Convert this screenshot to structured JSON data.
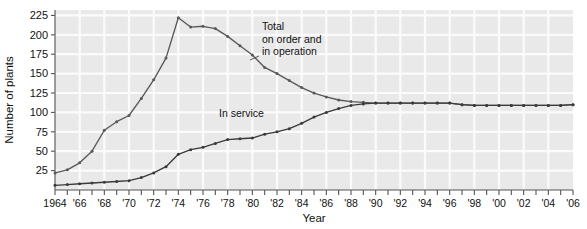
{
  "chart_data": {
    "type": "line",
    "title": "",
    "xlabel": "Year",
    "ylabel": "Number of plants",
    "xlim": [
      1964,
      2006
    ],
    "ylim": [
      0,
      232
    ],
    "yticks": [
      25,
      50,
      75,
      100,
      125,
      150,
      175,
      200,
      225
    ],
    "ytick_labels": [
      "25",
      "50",
      "75",
      "100",
      "125",
      "150",
      "175",
      "200",
      "225"
    ],
    "xticks": [
      1964,
      1965,
      1966,
      1967,
      1968,
      1969,
      1970,
      1971,
      1972,
      1973,
      1974,
      1975,
      1976,
      1977,
      1978,
      1979,
      1980,
      1981,
      1982,
      1983,
      1984,
      1985,
      1986,
      1987,
      1988,
      1989,
      1990,
      1991,
      1992,
      1993,
      1994,
      1995,
      1996,
      1997,
      1998,
      1999,
      2000,
      2001,
      2002,
      2003,
      2004,
      2005,
      2006
    ],
    "xtick_labels": [
      "1964",
      "",
      "'66",
      "",
      "'68",
      "",
      "'70",
      "",
      "'72",
      "",
      "'74",
      "",
      "'76",
      "",
      "'78",
      "",
      "'80",
      "",
      "'82",
      "",
      "'84",
      "",
      "'86",
      "",
      "'88",
      "",
      "'90",
      "",
      "'92",
      "",
      "'94",
      "",
      "'96",
      "",
      "'98",
      "",
      "'00",
      "",
      "'02",
      "",
      "'04",
      "",
      "'06"
    ],
    "grid": true,
    "legend_position": "inline-annotation",
    "x": [
      1964,
      1965,
      1966,
      1967,
      1968,
      1969,
      1970,
      1971,
      1972,
      1973,
      1974,
      1975,
      1976,
      1977,
      1978,
      1979,
      1980,
      1981,
      1982,
      1983,
      1984,
      1985,
      1986,
      1987,
      1988,
      1989,
      1990,
      1991,
      1992,
      1993,
      1994,
      1995,
      1996,
      1997,
      1998,
      1999,
      2000,
      2001,
      2002,
      2003,
      2004,
      2005,
      2006
    ],
    "series": [
      {
        "name": "Total on order and in operation",
        "color": "#595959",
        "values": [
          22,
          26,
          35,
          50,
          77,
          88,
          96,
          118,
          142,
          170,
          222,
          210,
          211,
          208,
          198,
          186,
          174,
          158,
          150,
          141,
          132,
          125,
          120,
          116,
          114,
          113,
          112,
          112,
          112,
          112,
          112,
          112,
          112,
          110,
          109,
          109,
          109,
          109,
          109,
          109,
          109,
          109,
          110
        ]
      },
      {
        "name": "In service",
        "color": "#3a3a3a",
        "values": [
          6,
          7,
          8,
          9,
          10,
          11,
          12,
          16,
          22,
          30,
          46,
          52,
          55,
          60,
          65,
          66,
          67,
          72,
          75,
          79,
          86,
          94,
          100,
          105,
          109,
          111,
          112,
          112,
          112,
          112,
          112,
          112,
          112,
          110,
          109,
          109,
          109,
          109,
          109,
          109,
          109,
          109,
          110
        ]
      }
    ],
    "annotations": [
      {
        "name": "total-label",
        "lines": [
          "Total",
          "on order and",
          "in operation"
        ],
        "x": 262,
        "y": 30
      },
      {
        "name": "in-service-label",
        "lines": [
          "In service"
        ],
        "x": 219,
        "y": 117
      }
    ],
    "colors": {
      "plot_background": "#e9e9e9",
      "gridline": "#fbfbfb",
      "axis": "#555555",
      "page_background": "#ffffff",
      "text": "#111111"
    }
  }
}
